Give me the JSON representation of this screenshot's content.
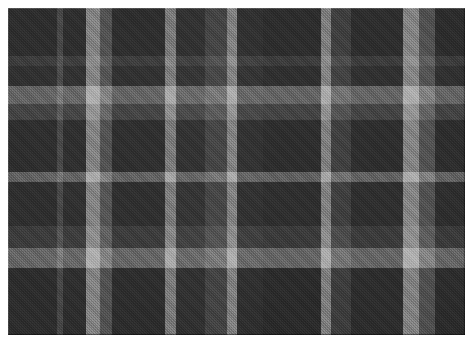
{
  "image": {
    "title": "Tartan Fabric Swatch",
    "subject": "grayscale plaid / tartan woven cloth close-up",
    "width": 473,
    "height": 343,
    "page_background": "#ffffff",
    "margin": {
      "top": 8,
      "left": 8,
      "right": 8,
      "bottom": 8
    },
    "weave": {
      "type": "twill",
      "direction": "45deg",
      "thread_pitch_px": 2
    },
    "palette": {
      "ground_dark": "#232323",
      "dark": "#2b2b2b",
      "mid_dark": "#383838",
      "mid": "#4a4a4a",
      "light": "#6e6e6e",
      "highlight": "#b9b9b9",
      "white_stripe": "#d9d9d9"
    }
  },
  "chart_data": {
    "type": "heatmap",
    "xlabel": "warp position (px)",
    "ylabel": "weft position (px)",
    "xlim": [
      0,
      457
    ],
    "ylim": [
      0,
      327
    ],
    "grid": false,
    "legend": "none",
    "warp_stripes": [
      {
        "start": 0,
        "width": 49,
        "gray": 40,
        "tone": "dark"
      },
      {
        "start": 49,
        "width": 6,
        "gray": 74,
        "tone": "mid"
      },
      {
        "start": 55,
        "width": 23,
        "gray": 42,
        "tone": "dark"
      },
      {
        "start": 78,
        "width": 14,
        "gray": 150,
        "tone": "white_stripe"
      },
      {
        "start": 92,
        "width": 12,
        "gray": 88,
        "tone": "light"
      },
      {
        "start": 104,
        "width": 53,
        "gray": 40,
        "tone": "dark"
      },
      {
        "start": 157,
        "width": 11,
        "gray": 140,
        "tone": "white_stripe"
      },
      {
        "start": 168,
        "width": 29,
        "gray": 46,
        "tone": "dark"
      },
      {
        "start": 197,
        "width": 22,
        "gray": 70,
        "tone": "mid"
      },
      {
        "start": 219,
        "width": 10,
        "gray": 148,
        "tone": "white_stripe"
      },
      {
        "start": 229,
        "width": 26,
        "gray": 44,
        "tone": "dark"
      },
      {
        "start": 255,
        "width": 58,
        "gray": 38,
        "tone": "dark"
      },
      {
        "start": 313,
        "width": 10,
        "gray": 146,
        "tone": "white_stripe"
      },
      {
        "start": 323,
        "width": 20,
        "gray": 62,
        "tone": "mid"
      },
      {
        "start": 343,
        "width": 52,
        "gray": 40,
        "tone": "dark"
      },
      {
        "start": 395,
        "width": 16,
        "gray": 152,
        "tone": "white_stripe"
      },
      {
        "start": 411,
        "width": 16,
        "gray": 86,
        "tone": "light"
      },
      {
        "start": 427,
        "width": 30,
        "gray": 40,
        "tone": "dark"
      }
    ],
    "weft_stripes": [
      {
        "start": 0,
        "width": 48,
        "gray": 40,
        "tone": "dark"
      },
      {
        "start": 48,
        "width": 10,
        "gray": 72,
        "tone": "mid"
      },
      {
        "start": 58,
        "width": 20,
        "gray": 44,
        "tone": "dark"
      },
      {
        "start": 78,
        "width": 18,
        "gray": 148,
        "tone": "white_stripe"
      },
      {
        "start": 96,
        "width": 16,
        "gray": 86,
        "tone": "light"
      },
      {
        "start": 112,
        "width": 52,
        "gray": 40,
        "tone": "dark"
      },
      {
        "start": 164,
        "width": 10,
        "gray": 142,
        "tone": "white_stripe"
      },
      {
        "start": 174,
        "width": 44,
        "gray": 42,
        "tone": "dark"
      },
      {
        "start": 218,
        "width": 22,
        "gray": 70,
        "tone": "mid"
      },
      {
        "start": 240,
        "width": 20,
        "gray": 150,
        "tone": "white_stripe"
      },
      {
        "start": 260,
        "width": 67,
        "gray": 38,
        "tone": "dark"
      }
    ]
  }
}
